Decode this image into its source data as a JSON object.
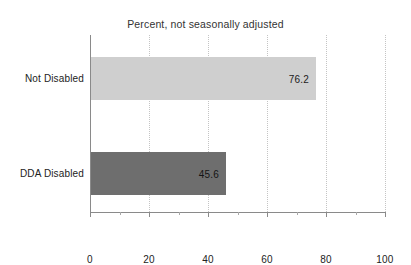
{
  "chart_data": {
    "type": "bar",
    "orientation": "horizontal",
    "title": "Percent, not seasonally adjusted",
    "xlabel": "",
    "ylabel": "",
    "categories": [
      "Not Disabled",
      "DDA Disabled"
    ],
    "values": [
      76.2,
      45.6
    ],
    "value_labels": [
      "76.2",
      "45.6"
    ],
    "xlim": [
      0,
      100
    ],
    "xticks": [
      0,
      20,
      40,
      60,
      80,
      100
    ],
    "xtick_labels": [
      "0",
      "20",
      "40",
      "60",
      "80",
      "100"
    ],
    "minor_xticks": [
      10,
      30,
      50,
      70,
      90
    ],
    "gridlines": [
      20,
      40,
      60,
      80,
      100
    ],
    "grid": true,
    "grid_style": "dotted",
    "legend": null,
    "series": [
      {
        "name": "Percent",
        "values": [
          76.2,
          45.6
        ],
        "colors": [
          "#cfcfcf",
          "#6e6e6e"
        ]
      }
    ],
    "bar_colors": {
      "not_disabled": "#cfcfcf",
      "dda_disabled": "#6e6e6e"
    },
    "axis_color": "#8a8a8a",
    "grid_color": "#c4c4c4",
    "text_color": "#222222"
  }
}
